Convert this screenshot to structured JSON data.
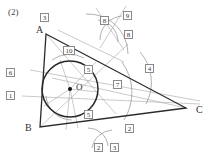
{
  "figure": {
    "question_number": "(2)",
    "vertices": [
      {
        "name": "A",
        "label": "A",
        "x": 42,
        "y": 31
      },
      {
        "name": "B",
        "label": "B",
        "x": 31,
        "y": 129
      },
      {
        "name": "C",
        "label": "C",
        "x": 193,
        "y": 111
      },
      {
        "name": "O",
        "label": "O",
        "x": 74,
        "y": 88
      }
    ],
    "center_dot": {
      "cx": 70,
      "cy": 89,
      "r": 2.0
    },
    "incircle": {
      "cx": 70,
      "cy": 89,
      "r": 28
    },
    "triangle_points": "46,34 186,108 40,127",
    "stroke_dark": "#2f2f2f",
    "stroke_mid": "#6f6f6f",
    "stroke_light": "#9a9a9a"
  },
  "labels": {
    "boxed": [
      {
        "id": "box-3-top",
        "text": "3",
        "x": 40,
        "y": 13
      },
      {
        "id": "box-8-left",
        "text": "8",
        "x": 100,
        "y": 16
      },
      {
        "id": "box-9",
        "text": "9",
        "x": 123,
        "y": 11
      },
      {
        "id": "box-8-right",
        "text": "8",
        "x": 124,
        "y": 30
      },
      {
        "id": "box-10",
        "text": "10",
        "x": 63,
        "y": 46
      },
      {
        "id": "box-6",
        "text": "6",
        "x": 6,
        "y": 68
      },
      {
        "id": "box-5-upper",
        "text": "5",
        "x": 84,
        "y": 65
      },
      {
        "id": "box-4",
        "text": "4",
        "x": 145,
        "y": 64
      },
      {
        "id": "box-1",
        "text": "1",
        "x": 6,
        "y": 91
      },
      {
        "id": "box-7",
        "text": "7",
        "x": 113,
        "y": 80
      },
      {
        "id": "box-5-lower",
        "text": "5",
        "x": 84,
        "y": 110
      },
      {
        "id": "box-2-right",
        "text": "2",
        "x": 125,
        "y": 124
      },
      {
        "id": "box-2-bottom",
        "text": "2",
        "x": 94,
        "y": 143
      },
      {
        "id": "box-3-bottom",
        "text": "3",
        "x": 110,
        "y": 143
      }
    ]
  }
}
